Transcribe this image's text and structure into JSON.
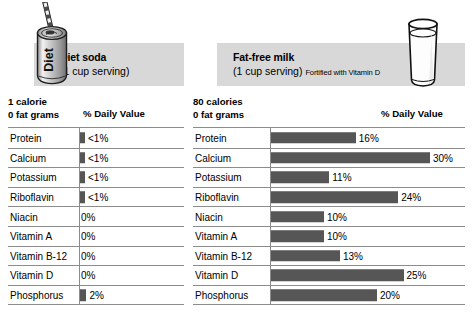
{
  "left_panel": {
    "illustration_icon": "diet-soda-can-icon",
    "can_label": "Diet",
    "product_name": "Diet soda",
    "serving": "(1 cup serving)",
    "serving_note": "",
    "calories": "1 calorie",
    "fat": "0 fat grams",
    "daily_value_header": "% Daily Value",
    "rows": [
      {
        "nutrient": "Protein",
        "label": "<1%",
        "value": 0.5
      },
      {
        "nutrient": "Calcium",
        "label": "<1%",
        "value": 0.5
      },
      {
        "nutrient": "Potassium",
        "label": "<1%",
        "value": 0.5
      },
      {
        "nutrient": "Riboflavin",
        "label": "<1%",
        "value": 0.5
      },
      {
        "nutrient": "Niacin",
        "label": "0%",
        "value": 0
      },
      {
        "nutrient": "Vitamin A",
        "label": "0%",
        "value": 0
      },
      {
        "nutrient": "Vitamin B-12",
        "label": "0%",
        "value": 0
      },
      {
        "nutrient": "Vitamin D",
        "label": "0%",
        "value": 0
      },
      {
        "nutrient": "Phosphorus",
        "label": "2%",
        "value": 2
      }
    ]
  },
  "right_panel": {
    "illustration_icon": "milk-glass-icon",
    "product_name": "Fat-free milk",
    "serving": "(1 cup serving)",
    "serving_note": "Fortified with Vitamin D",
    "calories": "80 calories",
    "fat": "0 fat grams",
    "daily_value_header": "% Daily Value",
    "rows": [
      {
        "nutrient": "Protein",
        "label": "16%",
        "value": 16
      },
      {
        "nutrient": "Calcium",
        "label": "30%",
        "value": 30
      },
      {
        "nutrient": "Potassium",
        "label": "11%",
        "value": 11
      },
      {
        "nutrient": "Riboflavin",
        "label": "24%",
        "value": 24
      },
      {
        "nutrient": "Niacin",
        "label": "10%",
        "value": 10
      },
      {
        "nutrient": "Vitamin A",
        "label": "10%",
        "value": 10
      },
      {
        "nutrient": "Vitamin B-12",
        "label": "13%",
        "value": 13
      },
      {
        "nutrient": "Vitamin D",
        "label": "25%",
        "value": 25
      },
      {
        "nutrient": "Phosphorus",
        "label": "20%",
        "value": 20
      }
    ]
  },
  "chart_data": {
    "type": "bar",
    "xlabel": "% Daily Value",
    "ylabel": "",
    "xlim": [
      0,
      30
    ],
    "grid": false,
    "legend_position": "none",
    "categories": [
      "Protein",
      "Calcium",
      "Potassium",
      "Riboflavin",
      "Niacin",
      "Vitamin A",
      "Vitamin B-12",
      "Vitamin D",
      "Phosphorus"
    ],
    "series": [
      {
        "name": "Diet soda (1 calorie, 0 fat grams)",
        "labels": [
          "<1%",
          "<1%",
          "<1%",
          "<1%",
          "0%",
          "0%",
          "0%",
          "0%",
          "2%"
        ],
        "values": [
          0.5,
          0.5,
          0.5,
          0.5,
          0,
          0,
          0,
          0,
          2
        ]
      },
      {
        "name": "Fat-free milk (80 calories, 0 fat grams)",
        "labels": [
          "16%",
          "30%",
          "11%",
          "24%",
          "10%",
          "10%",
          "13%",
          "25%",
          "20%"
        ],
        "values": [
          16,
          30,
          11,
          24,
          10,
          10,
          13,
          25,
          20
        ]
      }
    ],
    "colors": {
      "bar": "#565656",
      "header_band": "#d8d8d8",
      "rule": "#8c8c8c"
    }
  },
  "scale": {
    "left_px_per_pct": 3.2,
    "right_px_per_pct": 5.3,
    "min_bar_px": 5
  }
}
